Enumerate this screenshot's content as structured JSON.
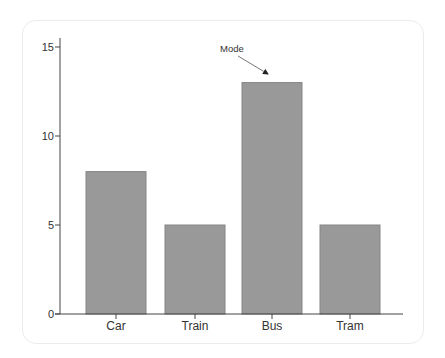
{
  "chart_data": {
    "type": "bar",
    "title": "",
    "xlabel": "",
    "ylabel": "",
    "categories": [
      "Car",
      "Train",
      "Bus",
      "Tram"
    ],
    "values": [
      8,
      5,
      13,
      5
    ],
    "ylim": [
      0,
      15
    ],
    "yticks": [
      0,
      5,
      10,
      15
    ],
    "grid": false,
    "legend": null,
    "bar_color": "#999999",
    "bar_edge_color": "#858585",
    "annotations": [
      {
        "text": "Mode",
        "target_category": "Bus",
        "arrow": true
      }
    ]
  },
  "axis": {
    "y_tick_labels": [
      "0",
      "5",
      "10",
      "15"
    ],
    "x_tick_labels": [
      "Car",
      "Train",
      "Bus",
      "Tram"
    ]
  },
  "annotation": {
    "label": "Mode"
  }
}
